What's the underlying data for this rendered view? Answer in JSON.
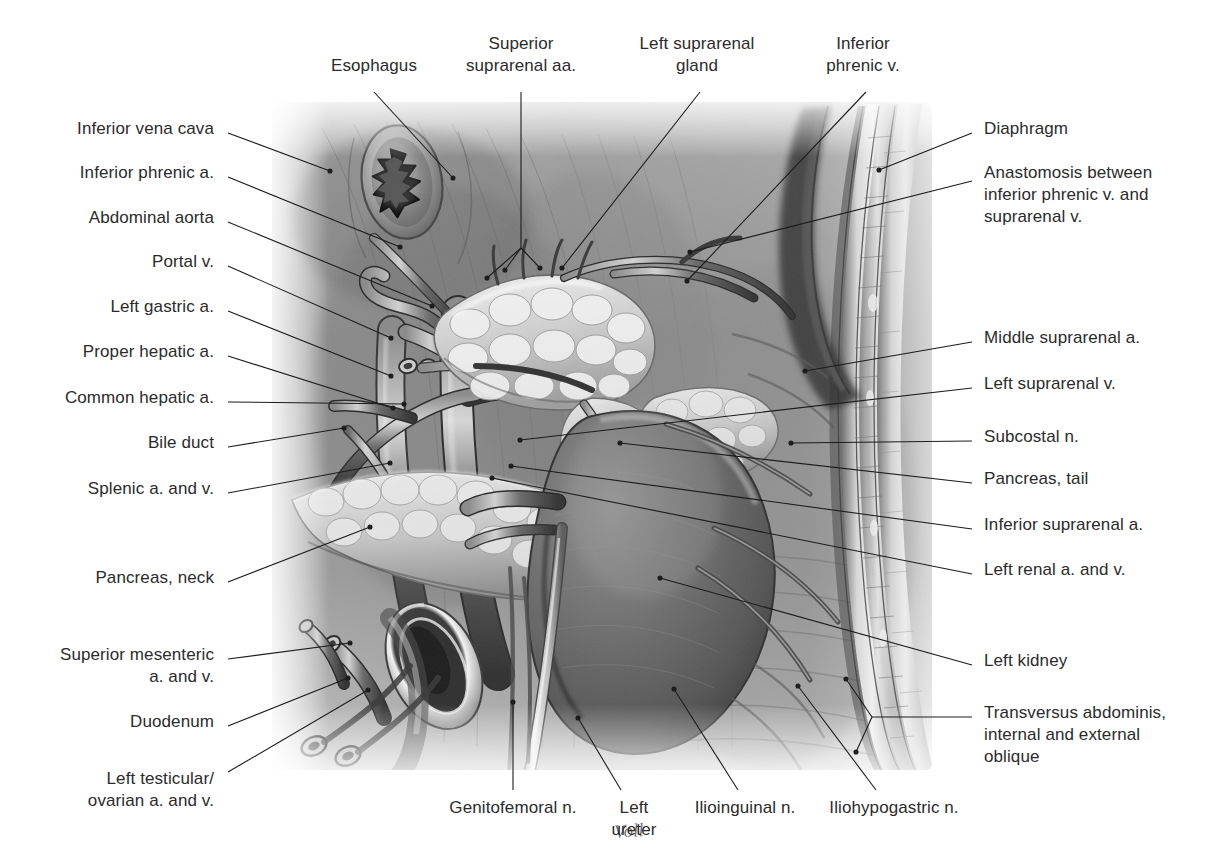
{
  "plate": {
    "kind": "anatomical-illustration",
    "subject": "Left suprarenal gland, left kidney and retroperitoneal vessels of the posterior abdominal wall",
    "rendering": "grayscale airbrush / pencil medical illustration",
    "artist_signature": "Voll",
    "background_color": "#ffffff",
    "label_color": "#2b2b2b",
    "leader_color": "#1c1c1c"
  },
  "labels_left": [
    {
      "id": "inferior-vena-cava",
      "text": "Inferior vena cava",
      "x": 214,
      "y": 129
    },
    {
      "id": "inferior-phrenic-a",
      "text": "Inferior phrenic a.",
      "x": 214,
      "y": 173
    },
    {
      "id": "abdominal-aorta",
      "text": "Abdominal aorta",
      "x": 214,
      "y": 218
    },
    {
      "id": "portal-v",
      "text": "Portal v.",
      "x": 214,
      "y": 262
    },
    {
      "id": "left-gastric-a",
      "text": "Left gastric a.",
      "x": 214,
      "y": 307
    },
    {
      "id": "proper-hepatic-a",
      "text": "Proper hepatic a.",
      "x": 214,
      "y": 352
    },
    {
      "id": "common-hepatic-a",
      "text": "Common hepatic a.",
      "x": 214,
      "y": 398
    },
    {
      "id": "bile-duct",
      "text": "Bile duct",
      "x": 214,
      "y": 443
    },
    {
      "id": "splenic-a-and-v",
      "text": "Splenic a. and v.",
      "x": 214,
      "y": 489
    },
    {
      "id": "pancreas-neck",
      "text": "Pancreas, neck",
      "x": 214,
      "y": 578
    },
    {
      "id": "superior-mesenteric-a-and-v",
      "text": "Superior mesenteric\na. and v.",
      "x": 214,
      "y": 655
    },
    {
      "id": "duodenum",
      "text": "Duodenum",
      "x": 214,
      "y": 722
    },
    {
      "id": "left-testicular-ovarian-a-and-v",
      "text": "Left testicular/\novarian a. and v.",
      "x": 214,
      "y": 779
    }
  ],
  "labels_right": [
    {
      "id": "diaphragm",
      "text": "Diaphragm",
      "x": 984,
      "y": 129
    },
    {
      "id": "anastomosis-inferior-phrenic-suprarenal",
      "text": "Anastomosis between\ninferior phrenic v. and\nsuprarenal v.",
      "x": 984,
      "y": 173
    },
    {
      "id": "middle-suprarenal-a",
      "text": "Middle suprarenal a.",
      "x": 984,
      "y": 338
    },
    {
      "id": "left-suprarenal-v",
      "text": "Left suprarenal v.",
      "x": 984,
      "y": 384
    },
    {
      "id": "subcostal-n",
      "text": "Subcostal n.",
      "x": 984,
      "y": 437
    },
    {
      "id": "pancreas-tail",
      "text": "Pancreas, tail",
      "x": 984,
      "y": 479
    },
    {
      "id": "inferior-suprarenal-a",
      "text": "Inferior suprarenal a.",
      "x": 984,
      "y": 525
    },
    {
      "id": "left-renal-a-and-v",
      "text": "Left renal a. and v.",
      "x": 984,
      "y": 570
    },
    {
      "id": "left-kidney",
      "text": "Left kidney",
      "x": 984,
      "y": 661
    },
    {
      "id": "transversus-abdominis-internal-external-oblique",
      "text": "Transversus abdominis,\ninternal and external\noblique",
      "x": 984,
      "y": 713
    }
  ],
  "labels_top": [
    {
      "id": "esophagus",
      "text": "Esophagus",
      "x": 374,
      "y": 66,
      "align": "center"
    },
    {
      "id": "superior-suprarenal-aa",
      "text": "Superior\nsuprarenal aa.",
      "x": 521,
      "y": 44,
      "align": "center"
    },
    {
      "id": "left-suprarenal-gland",
      "text": "Left suprarenal\ngland",
      "x": 697,
      "y": 44,
      "align": "center"
    },
    {
      "id": "inferior-phrenic-v",
      "text": "Inferior\nphrenic v.",
      "x": 863,
      "y": 44,
      "align": "center"
    }
  ],
  "labels_bottom": [
    {
      "id": "genitofemoral-n",
      "text": "Genitofemoral n.",
      "x": 513,
      "y": 808,
      "align": "center"
    },
    {
      "id": "left-ureter",
      "text": "Left\nureter",
      "x": 634,
      "y": 808,
      "align": "center"
    },
    {
      "id": "ilioinguinal-n",
      "text": "Ilioinguinal n.",
      "x": 745,
      "y": 808,
      "align": "center"
    },
    {
      "id": "iliohypogastric-n",
      "text": "Iliohypogastric n.",
      "x": 894,
      "y": 808,
      "align": "center"
    }
  ],
  "structures": [
    {
      "id": "esophagus",
      "note": "oval cross-section with stellate mucosal lumen, upper left of field"
    },
    {
      "id": "left-suprarenal-gland",
      "note": "pale lobulated triangular gland capping the kidney"
    },
    {
      "id": "left-kidney",
      "note": "large dark bean-shaped organ, right of centre"
    },
    {
      "id": "pancreas",
      "note": "pale lobulated body sweeping from left across to the hilum"
    },
    {
      "id": "duodenum",
      "note": "cut ring of bowel, lower left"
    },
    {
      "id": "abdominal-aorta",
      "note": "large vertical vessel, left of midline"
    },
    {
      "id": "inferior-vena-cava",
      "note": "vessel trunk left of aorta in the field"
    },
    {
      "id": "posterior-abdominal-wall",
      "note": "layered muscle strips along right edge"
    },
    {
      "id": "left-ureter",
      "note": "pale tube descending from renal hilum to lower edge"
    }
  ],
  "signature": {
    "text": "Voll"
  }
}
